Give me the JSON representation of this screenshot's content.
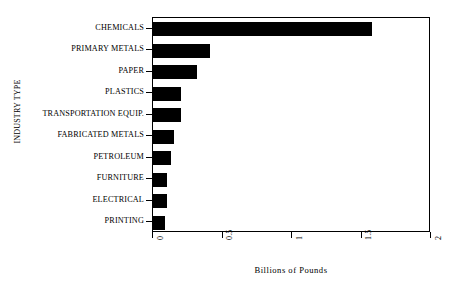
{
  "chart_data": {
    "type": "bar",
    "orientation": "horizontal",
    "title": "",
    "xlabel": "Billions of Pounds",
    "ylabel": "INDUSTRY TYPE",
    "categories": [
      "CHEMICALS",
      "PRIMARY METALS",
      "PAPER",
      "PLASTICS",
      "TRANSPORTATION EQUIP.",
      "FABRICATED METALS",
      "PETROLEUM",
      "FURNITURE",
      "ELECTRICAL",
      "PRINTING"
    ],
    "values": [
      1.575,
      0.41,
      0.32,
      0.2,
      0.2,
      0.15,
      0.13,
      0.1,
      0.1,
      0.085
    ],
    "xlim": [
      0,
      2
    ],
    "xticks": [
      0,
      0.5,
      1,
      1.5,
      2
    ],
    "xtick_labels": [
      "0",
      "0.5",
      "1",
      "1.5",
      "2"
    ],
    "grid": false,
    "legend": false,
    "bar_color": "#000000",
    "background_color": "#ffffff"
  }
}
